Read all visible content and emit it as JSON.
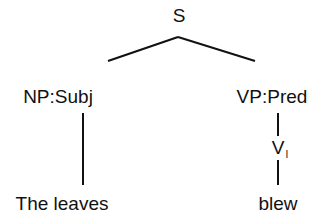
{
  "diagram": {
    "type": "syntax-tree",
    "root": {
      "label": "S"
    },
    "left_branch": {
      "label": "NP:Subj",
      "leaf": "The leaves"
    },
    "right_branch": {
      "label": "VP:Pred",
      "child": {
        "label": "V",
        "subscript": "I"
      },
      "leaf": "blew"
    }
  },
  "colors": {
    "line": "#111111",
    "text": "#111111",
    "background": "#ffffff"
  }
}
